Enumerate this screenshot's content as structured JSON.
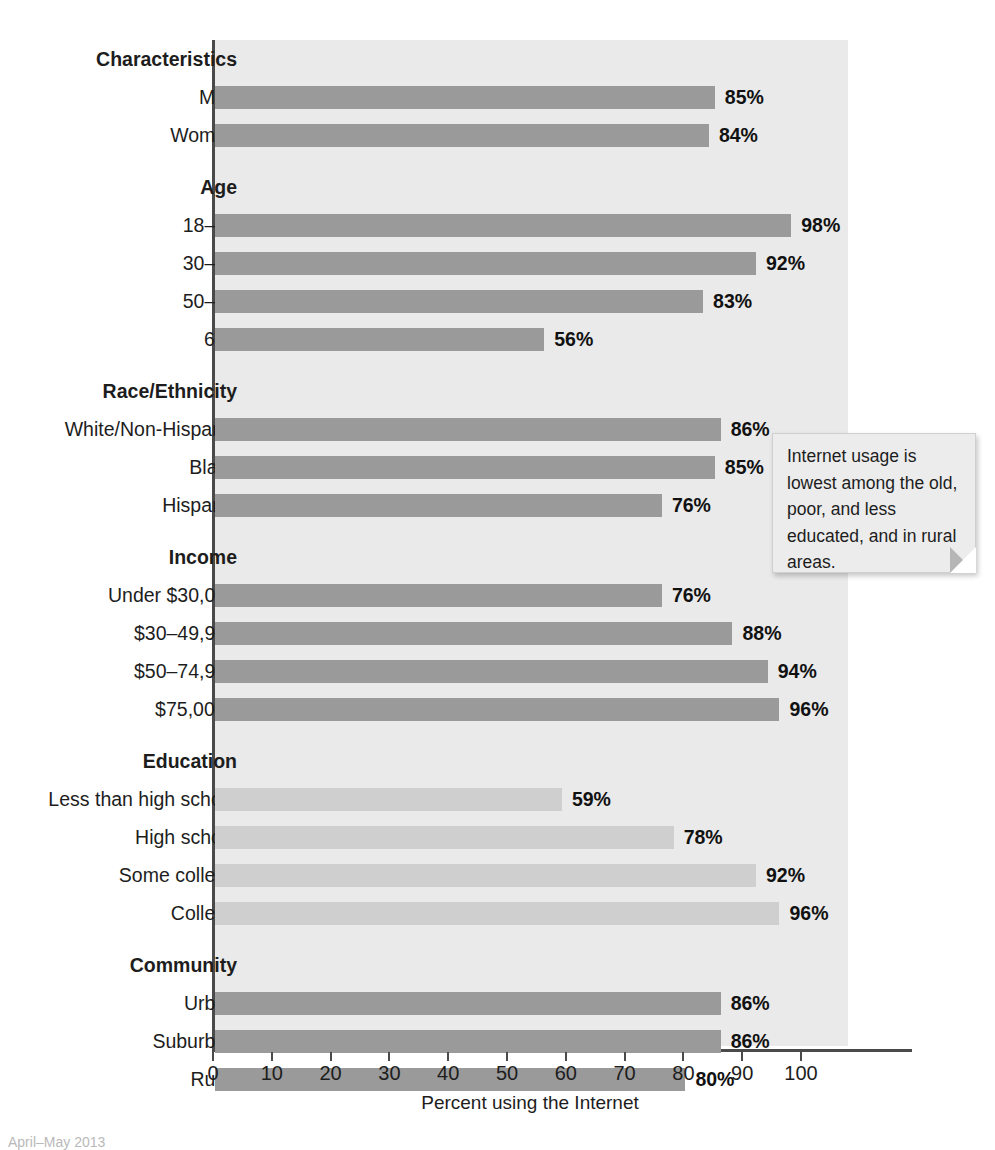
{
  "chart_data": {
    "type": "bar",
    "title": "",
    "xlabel": "Percent using the Internet",
    "ylabel": "",
    "xlim": [
      0,
      110
    ],
    "xticks": [
      0,
      10,
      20,
      30,
      40,
      50,
      60,
      70,
      80,
      90,
      100
    ],
    "orientation": "horizontal",
    "grid": false,
    "legend": "none",
    "groups": [
      {
        "name": "Characteristics",
        "items": [
          {
            "label": "Men",
            "value": 85,
            "value_label": "85%",
            "shade": "dark"
          },
          {
            "label": "Women",
            "value": 84,
            "value_label": "84%",
            "shade": "dark"
          }
        ]
      },
      {
        "name": "Age",
        "items": [
          {
            "label": "18–29",
            "value": 98,
            "value_label": "98%",
            "shade": "dark"
          },
          {
            "label": "30–49",
            "value": 92,
            "value_label": "92%",
            "shade": "dark"
          },
          {
            "label": "50–64",
            "value": 83,
            "value_label": "83%",
            "shade": "dark"
          },
          {
            "label": "65+",
            "value": 56,
            "value_label": "56%",
            "shade": "dark"
          }
        ]
      },
      {
        "name": "Race/Ethnicity",
        "items": [
          {
            "label": "White/Non-Hispanic",
            "value": 86,
            "value_label": "86%",
            "shade": "dark"
          },
          {
            "label": "Black",
            "value": 85,
            "value_label": "85%",
            "shade": "dark"
          },
          {
            "label": "Hispanic",
            "value": 76,
            "value_label": "76%",
            "shade": "dark"
          }
        ]
      },
      {
        "name": "Income",
        "items": [
          {
            "label": "Under $30,000",
            "value": 76,
            "value_label": "76%",
            "shade": "dark"
          },
          {
            "label": "$30–49,999",
            "value": 88,
            "value_label": "88%",
            "shade": "dark"
          },
          {
            "label": "$50–74,999",
            "value": 94,
            "value_label": "94%",
            "shade": "dark"
          },
          {
            "label": "$75,000+",
            "value": 96,
            "value_label": "96%",
            "shade": "dark"
          }
        ]
      },
      {
        "name": "Education",
        "items": [
          {
            "label": "Less than high school",
            "value": 59,
            "value_label": "59%",
            "shade": "light"
          },
          {
            "label": "High school",
            "value": 78,
            "value_label": "78%",
            "shade": "light"
          },
          {
            "label": "Some college",
            "value": 92,
            "value_label": "92%",
            "shade": "light"
          },
          {
            "label": "College",
            "value": 96,
            "value_label": "96%",
            "shade": "light"
          }
        ]
      },
      {
        "name": "Community",
        "items": [
          {
            "label": "Urban",
            "value": 86,
            "value_label": "86%",
            "shade": "dark"
          },
          {
            "label": "Suburban",
            "value": 86,
            "value_label": "86%",
            "shade": "dark"
          },
          {
            "label": "Rural",
            "value": 80,
            "value_label": "80%",
            "shade": "dark"
          }
        ]
      }
    ],
    "colors": {
      "bar_dark": "#9a9a9a",
      "bar_light": "#cfcfcf",
      "plot_background": "#eaeaea",
      "axis": "#4a4a4a",
      "text": "#1d1d1d"
    }
  },
  "annotation": {
    "text": "Internet usage is lowest among the old, poor, and less educated, and in rural areas."
  },
  "source_note": {
    "text": "April–May 2013"
  }
}
